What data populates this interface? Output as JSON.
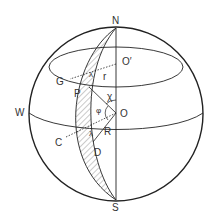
{
  "diagram": {
    "title": "",
    "labels": {
      "north": "N",
      "south": "S",
      "west": "W",
      "center": "O",
      "small_center": "O′",
      "point_g": "G",
      "point_p": "P",
      "point_c": "C",
      "point_d": "D",
      "radius_small": "r",
      "radius_large": "R",
      "angle_chi": "χ",
      "angle_phi": "φ",
      "lambda_upper": "λ",
      "lambda_lower": "λ"
    },
    "colors": {
      "stroke": "#222222",
      "hatch": "#555555",
      "background": "#ffffff"
    }
  }
}
